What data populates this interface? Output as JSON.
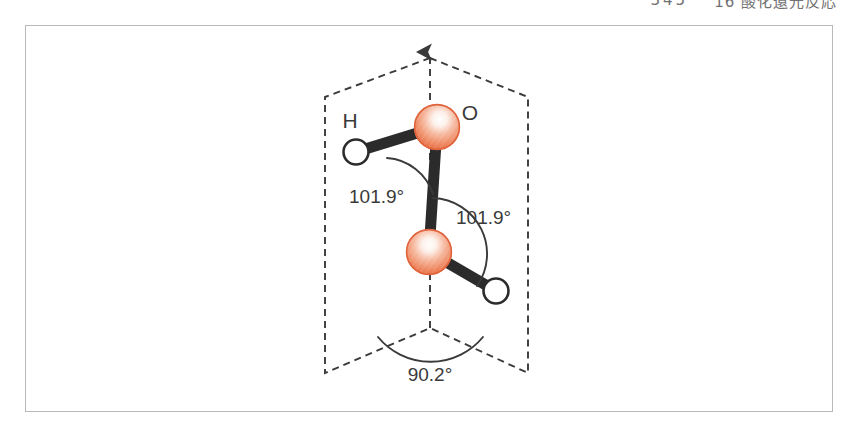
{
  "page_header": {
    "page_number": "345",
    "running_title": "16 酸化還元反応"
  },
  "figure": {
    "frame": {
      "border_color": "#b9b9b9",
      "background": "#ffffff"
    },
    "caption_labels": {
      "oxygen_symbol": "O",
      "hydrogen_symbol": "H"
    },
    "atoms": [
      {
        "id": "oxygen-top",
        "element": "O",
        "kind": "sphere",
        "color": "#EC7A52",
        "highlight": "#ffffff",
        "label": "O",
        "cx": 437,
        "cy": 127,
        "r": 23
      },
      {
        "id": "oxygen-bottom",
        "element": "O",
        "kind": "sphere",
        "color": "#EC7A52",
        "highlight": "#ffffff",
        "label": "",
        "cx": 429,
        "cy": 252,
        "r": 23
      },
      {
        "id": "hydrogen-left",
        "element": "H",
        "kind": "ring",
        "color": "#ffffff",
        "outline": "#2b2b2b",
        "label": "H",
        "cx": 356,
        "cy": 152,
        "r": 13
      },
      {
        "id": "hydrogen-right",
        "element": "H",
        "kind": "ring",
        "color": "#ffffff",
        "outline": "#2b2b2b",
        "label": "",
        "cx": 496,
        "cy": 291,
        "r": 13
      }
    ],
    "bonds": [
      {
        "id": "bond-H-Otop",
        "from": "hydrogen-left",
        "to": "oxygen-top",
        "color": "#2b2b2b"
      },
      {
        "id": "bond-Otop-Obot",
        "from": "oxygen-top",
        "to": "oxygen-bottom",
        "color": "#2b2b2b"
      },
      {
        "id": "bond-Obot-H",
        "from": "oxygen-bottom",
        "to": "hydrogen-right",
        "color": "#2b2b2b"
      }
    ],
    "angles": [
      {
        "id": "angle-top",
        "value": "101.9",
        "degree": "°",
        "text": "101.9°",
        "description": "H-O-O bond angle (upper)"
      },
      {
        "id": "angle-bottom",
        "value": "101.9",
        "degree": "°",
        "text": "101.9°",
        "description": "O-O-H bond angle (lower)"
      },
      {
        "id": "angle-dihedral",
        "value": "90.2",
        "degree": "°",
        "text": "90.2°",
        "description": "dihedral angle between the two planes"
      }
    ],
    "planes": {
      "style": "dashed",
      "color": "#3a3a3a",
      "hinge_line": "vertical dashed axis with arrow head at top",
      "left_plane_vertices": [
        [
          325,
          97
        ],
        [
          430,
          56
        ],
        [
          430,
          328
        ],
        [
          325,
          373
        ]
      ],
      "right_plane_vertices": [
        [
          430,
          56
        ],
        [
          528,
          97
        ],
        [
          528,
          373
        ],
        [
          430,
          328
        ]
      ]
    }
  }
}
